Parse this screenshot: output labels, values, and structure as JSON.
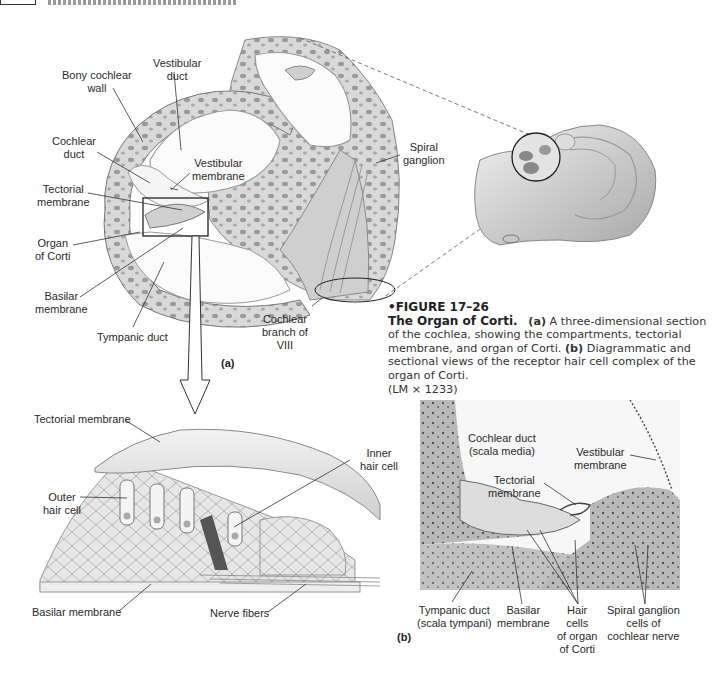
{
  "page_header": {
    "running_head": ""
  },
  "panel_a": {
    "tag": "(a)",
    "labels": {
      "bony_cochlear_wall": [
        "Bony cochlear",
        "wall"
      ],
      "vestibular_duct": [
        "Vestibular",
        "duct"
      ],
      "cochlear_duct": [
        "Cochlear",
        "duct"
      ],
      "vestibular_membrane": [
        "Vestibular",
        "membrane"
      ],
      "tectorial_membrane": [
        "Tectorial",
        "membrane"
      ],
      "organ_of_corti": [
        "Organ",
        "of Corti"
      ],
      "basilar_membrane": [
        "Basilar",
        "membrane"
      ],
      "tympanic_duct": "Tympanic duct",
      "spiral_ganglion": [
        "Spiral",
        "ganglion"
      ],
      "cochlear_branch": [
        "Cochlear",
        "branch of",
        "VIII"
      ]
    }
  },
  "caption": {
    "figure_number": "FIGURE 17–26",
    "title": "The Organ of Corti.",
    "part_a_tag": "(a)",
    "part_a_text": "A three-dimensional section of the cochlea, showing the compartments, tectorial membrane, and organ of Corti.",
    "part_b_tag": "(b)",
    "part_b_text": "Diagrammatic and sectional views of the receptor hair cell complex of the organ of Corti.",
    "magnification": "(LM × 1233)"
  },
  "panel_b": {
    "tag": "(b)",
    "diagram_labels": {
      "tectorial_membrane": "Tectorial membrane",
      "inner_hair_cell": [
        "Inner",
        "hair cell"
      ],
      "outer_hair_cell": [
        "Outer",
        "hair cell"
      ],
      "basilar_membrane": "Basilar membrane",
      "nerve_fibers": "Nerve fibers"
    },
    "micrograph_labels": {
      "cochlear_duct": [
        "Cochlear duct",
        "(scala media)"
      ],
      "vestibular_membrane": [
        "Vestibular",
        "membrane"
      ],
      "tectorial_membrane": [
        "Tectorial",
        "membrane"
      ],
      "tympanic_duct": [
        "Tympanic duct",
        "(scala tympani)"
      ],
      "basilar_membrane": [
        "Basilar",
        "membrane"
      ],
      "hair_cells": [
        "Hair",
        "cells",
        "of organ",
        "of Corti"
      ],
      "spiral_ganglion": [
        "Spiral ganglion",
        "cells of",
        "cochlear nerve"
      ]
    }
  }
}
